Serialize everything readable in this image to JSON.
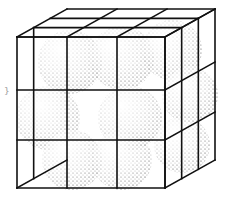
{
  "figure": {
    "lattice": {
      "cells_per_edge": 3,
      "front_face": {
        "x": [
          17,
          67,
          117,
          165
        ],
        "y": [
          37,
          90,
          140,
          188
        ]
      },
      "depth_offset": {
        "dx": 50,
        "dy": -28
      }
    },
    "spheres": [
      {
        "cx": 70,
        "cy": 62,
        "r": 32
      },
      {
        "cx": 122,
        "cy": 58,
        "r": 32
      },
      {
        "cx": 172,
        "cy": 50,
        "r": 30
      },
      {
        "cx": 48,
        "cy": 118,
        "r": 32
      },
      {
        "cx": 130,
        "cy": 118,
        "r": 32
      },
      {
        "cx": 190,
        "cy": 95,
        "r": 28
      },
      {
        "cx": 72,
        "cy": 160,
        "r": 30
      },
      {
        "cx": 122,
        "cy": 160,
        "r": 30
      },
      {
        "cx": 182,
        "cy": 145,
        "r": 28
      }
    ],
    "colors": {
      "line": "#111111",
      "stipple": "#222222",
      "background": "#ffffff"
    },
    "side_mark": "}"
  }
}
